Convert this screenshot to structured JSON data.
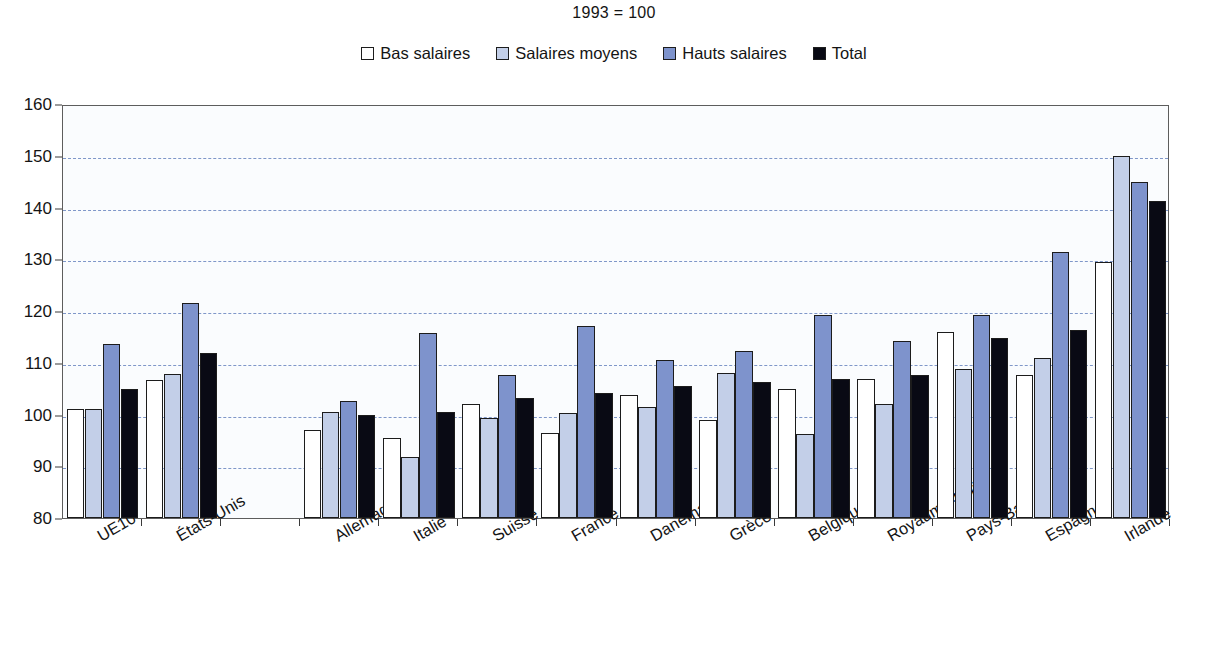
{
  "chart_data": {
    "type": "bar",
    "title": "1993 = 100",
    "xlabel": "",
    "ylabel": "",
    "ylim": [
      80,
      160
    ],
    "ytick_step": 10,
    "yticks": [
      80,
      90,
      100,
      110,
      120,
      130,
      140,
      150,
      160
    ],
    "grid": true,
    "grid_style": "dashed-horizontal",
    "grid_color": "#7f97c9",
    "legend_position": "top-center",
    "categories": [
      "UE10",
      "États-Unis",
      "",
      "Allemagne",
      "Italie",
      "Suisse",
      "France",
      "Danemark",
      "Grèce",
      "Belgique",
      "Royaume-Uni",
      "Pays-Bas",
      "Espagne",
      "Irlande"
    ],
    "series": [
      {
        "name": "Bas salaires",
        "color": "#ffffff",
        "values": [
          101.0,
          106.7,
          null,
          97.0,
          95.5,
          102.0,
          96.5,
          103.7,
          99.0,
          104.9,
          106.8,
          115.9,
          107.6,
          129.4
        ]
      },
      {
        "name": "Salaires moyens",
        "color": "#c3cfe8",
        "values": [
          101.0,
          107.8,
          null,
          100.5,
          91.8,
          99.3,
          100.3,
          101.5,
          108.0,
          96.2,
          102.0,
          108.7,
          111.0,
          149.9
        ]
      },
      {
        "name": "Hauts salaires",
        "color": "#7e93cc",
        "values": [
          113.7,
          121.5,
          null,
          102.6,
          115.7,
          107.7,
          117.2,
          110.5,
          112.2,
          119.3,
          114.3,
          119.3,
          131.5,
          145.0
        ]
      },
      {
        "name": "Total",
        "color": "#090a14",
        "values": [
          105.0,
          111.8,
          null,
          100.0,
          100.5,
          103.1,
          104.1,
          105.5,
          106.3,
          106.8,
          107.6,
          114.8,
          116.3,
          141.3
        ]
      }
    ]
  },
  "legend": {
    "items": [
      {
        "label": "Bas salaires",
        "swatch": "legend-swatch-bas-salaires"
      },
      {
        "label": "Salaires moyens",
        "swatch": "legend-swatch-salaires-moyens"
      },
      {
        "label": "Hauts salaires",
        "swatch": "legend-swatch-hauts-salaires"
      },
      {
        "label": "Total",
        "swatch": "legend-swatch-total"
      }
    ]
  }
}
